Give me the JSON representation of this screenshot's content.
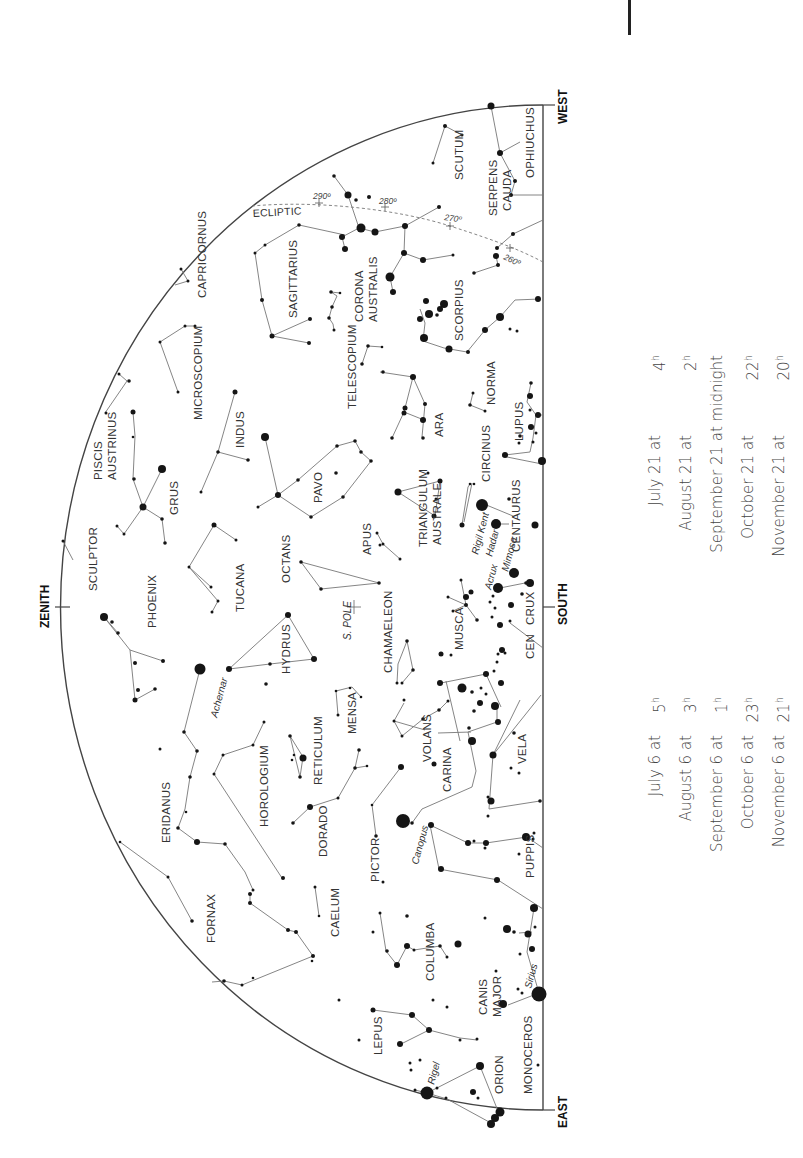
{
  "directions": {
    "west": "WEST",
    "east": "EAST",
    "south": "SOUTH",
    "zenith": "ZENITH"
  },
  "markers": {
    "south_pole": "S. POLE",
    "ecliptic": "ECLIPTIC",
    "ecliptic_degrees": [
      "290º",
      "280º",
      "270º",
      "260º"
    ]
  },
  "constellations": [
    "OPHIUCHUS",
    "SCUTUM",
    "SERPENS CAUDA",
    "CAPRICORNUS",
    "SAGITTARIUS",
    "CORONA AUSTRALIS",
    "SCORPIUS",
    "MICROSCOPIUM",
    "TELESCOPIUM",
    "NORMA",
    "PISCIS AUSTRINUS",
    "INDUS",
    "ARA",
    "LUPUS",
    "GRUS",
    "PAVO",
    "CIRCINUS",
    "CENTAURUS",
    "SCULPTOR",
    "TUCANA",
    "OCTANS",
    "APUS",
    "TRIANGULUM AUSTRALE",
    "PHOENIX",
    "HYDRUS",
    "CHAMAELEON",
    "MUSCA",
    "CRUX",
    "CEN",
    "ERIDANUS",
    "HOROLOGIUM",
    "RETICULUM",
    "MENSA",
    "VOLANS",
    "CARINA",
    "VELA",
    "DORADO",
    "PICTOR",
    "PUPPIS",
    "FORNAX",
    "CAELUM",
    "COLUMBA",
    "CANIS MAJOR",
    "LEPUS",
    "ORION",
    "MONOCEROS"
  ],
  "stars": {
    "rigil_kent": "Rigil Kent",
    "hadar": "Hadar",
    "mimosa": "Mimosa",
    "acrux": "Acrux",
    "achernar": "Achernar",
    "canopus": "Canopus",
    "sirius": "Sirius",
    "rigel": "Rigel"
  },
  "viewing_times": {
    "day6": [
      {
        "date": "July 6 at",
        "hour": "5",
        "unit": "h"
      },
      {
        "date": "August 6 at",
        "hour": "3",
        "unit": "h"
      },
      {
        "date": "September 6 at",
        "hour": "1",
        "unit": "h"
      },
      {
        "date": "October 6 at",
        "hour": "23",
        "unit": "h"
      },
      {
        "date": "November 6 at",
        "hour": "21",
        "unit": "h"
      }
    ],
    "day21": [
      {
        "date": "July 21 at",
        "hour": "4",
        "unit": "h"
      },
      {
        "date": "August 21 at",
        "hour": "2",
        "unit": "h"
      },
      {
        "date": "September 21 at midnight",
        "hour": "",
        "unit": ""
      },
      {
        "date": "October 21 at",
        "hour": "22",
        "unit": "h"
      },
      {
        "date": "November 21 at",
        "hour": "20",
        "unit": "h"
      }
    ]
  }
}
